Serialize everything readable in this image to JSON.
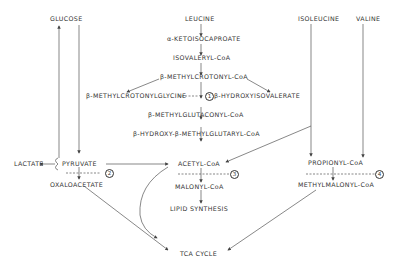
{
  "nodes": {
    "glucose": "GLUCOSE",
    "leucine": "LEUCINE",
    "ketoisocaproate": "α-KETOISOCAPROATE",
    "isovaleryl_coa": "ISOVALERYL-CoA",
    "methylcrotonyl_coa": "β-METHYLCROTONYL-CoA",
    "methylcrotonylglycine": "β-METHYLCROTONYLGLYCINE",
    "hydroxyisovalerate": "β-HYDROXYISOVALERATE",
    "methylglutaconyl_coa": "β-METHYLGLUTACONYL-CoA",
    "hmg_coa": "β-HYDROXY-β-METHYLGLUTARYL-CoA",
    "isoleucine": "ISOLEUCINE",
    "valine": "VALINE",
    "lactate": "LACTATE",
    "pyruvate": "PYRUVATE",
    "oxaloacetate": "OXALOACETATE",
    "acetyl_coa": "ACETYL-CoA",
    "malonyl_coa": "MALONYL-CoA",
    "lipid_synthesis": "LIPID SYNTHESIS",
    "propionyl_coa": "PROPIONYL-CoA",
    "methylmalonyl_coa": "METHYLMALONYL-CoA",
    "tca_cycle": "TCA CYCLE"
  },
  "blocks": [
    "1",
    "2",
    "3",
    "4"
  ],
  "colors": {
    "line": "#444444",
    "text": "#333333",
    "background": "#ffffff"
  }
}
